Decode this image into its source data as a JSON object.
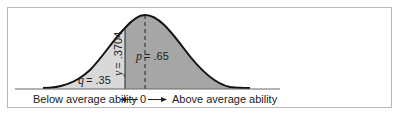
{
  "figure": {
    "q_label": {
      "var": "q",
      "value": "= .35"
    },
    "p_label": {
      "var": "p",
      "value": "= .65"
    },
    "y_label": {
      "var": "y",
      "value": "= .3704"
    },
    "axis": {
      "left_text": "Below average ability",
      "center_text": "0",
      "right_text": "Above average ability"
    },
    "colors": {
      "light_region": "#d9d9d9",
      "dark_region": "#a6a6a6",
      "curve": "#111111",
      "frame": "#b8b8b8"
    }
  }
}
